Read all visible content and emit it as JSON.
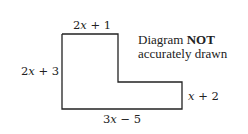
{
  "diagram": {
    "type": "L-shaped polygon (rectilinear)",
    "labels": {
      "top": {
        "pre": "2",
        "var": "x",
        "post": " + 1"
      },
      "left": {
        "pre": "2",
        "var": "x",
        "post": " + 3"
      },
      "right_lower": {
        "pre": "",
        "var": "x",
        "post": " + 2"
      },
      "bottom": {
        "pre": "3",
        "var": "x",
        "post": " − 5"
      }
    },
    "note": {
      "line1_pre": "Diagram ",
      "line1_bold": "NOT",
      "line2": "accurately drawn"
    },
    "colors": {
      "stroke": "#222222",
      "background": "#ffffff"
    }
  }
}
